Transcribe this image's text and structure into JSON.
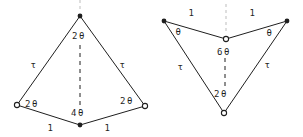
{
  "canvas": {
    "width": 303,
    "height": 137,
    "background": "#ffffff"
  },
  "style": {
    "line_color": "#1f1f1f",
    "faint_color": "#bdbdbd",
    "text_color": "#1f1f1f",
    "marker_fill_open": "#ffffff"
  },
  "diagram": {
    "type": "geometry",
    "figures": [
      {
        "name": "kite",
        "vertices": [
          {
            "id": "apex",
            "x": 80,
            "y": 16,
            "marker": "filled"
          },
          {
            "id": "left",
            "x": 17,
            "y": 105,
            "marker": "open"
          },
          {
            "id": "right",
            "x": 145,
            "y": 106,
            "marker": "open"
          },
          {
            "id": "bottom",
            "x": 80,
            "y": 125,
            "marker": "filled"
          }
        ],
        "edges": [
          {
            "from": "apex",
            "to": "left"
          },
          {
            "from": "apex",
            "to": "right"
          },
          {
            "from": "left",
            "to": "bottom"
          },
          {
            "from": "right",
            "to": "bottom"
          }
        ],
        "dashed_segments": [
          {
            "x1": 80,
            "y1": 45,
            "x2": 80,
            "y2": 110
          }
        ],
        "guide_segments": [
          {
            "x1": 80,
            "y1": 0,
            "x2": 80,
            "y2": 12
          }
        ],
        "labels": [
          {
            "text": "2θ",
            "x": 79,
            "y": 36,
            "kind": "angle"
          },
          {
            "text": "τ",
            "x": 34,
            "y": 65,
            "kind": "side"
          },
          {
            "text": "τ",
            "x": 123,
            "y": 65,
            "kind": "side"
          },
          {
            "text": "2θ",
            "x": 32,
            "y": 104,
            "kind": "angle"
          },
          {
            "text": "2θ",
            "x": 127,
            "y": 101,
            "kind": "angle"
          },
          {
            "text": "4θ",
            "x": 78,
            "y": 113,
            "kind": "angle"
          },
          {
            "text": "1",
            "x": 51,
            "y": 128,
            "kind": "side"
          },
          {
            "text": "1",
            "x": 108,
            "y": 128,
            "kind": "side"
          }
        ]
      },
      {
        "name": "dart",
        "vertices": [
          {
            "id": "top-left",
            "x": 164,
            "y": 21,
            "marker": "filled"
          },
          {
            "id": "top-right",
            "x": 287,
            "y": 21,
            "marker": "filled"
          },
          {
            "id": "middle",
            "x": 226,
            "y": 39,
            "marker": "open"
          },
          {
            "id": "bottom",
            "x": 224,
            "y": 113,
            "marker": "open"
          }
        ],
        "edges": [
          {
            "from": "top-left",
            "to": "middle"
          },
          {
            "from": "top-right",
            "to": "middle"
          },
          {
            "from": "top-left",
            "to": "bottom"
          },
          {
            "from": "top-right",
            "to": "bottom"
          }
        ],
        "dashed_segments": [
          {
            "x1": 225,
            "y1": 58,
            "x2": 225,
            "y2": 87
          }
        ],
        "guide_segments": [
          {
            "x1": 226,
            "y1": 4,
            "x2": 226,
            "y2": 33
          }
        ],
        "labels": [
          {
            "text": "1",
            "x": 192,
            "y": 13,
            "kind": "side"
          },
          {
            "text": "1",
            "x": 253,
            "y": 13,
            "kind": "side"
          },
          {
            "text": "θ",
            "x": 179,
            "y": 32,
            "kind": "angle"
          },
          {
            "text": "θ",
            "x": 270,
            "y": 33,
            "kind": "angle"
          },
          {
            "text": "6θ",
            "x": 224,
            "y": 52,
            "kind": "angle"
          },
          {
            "text": "τ",
            "x": 181,
            "y": 67,
            "kind": "side"
          },
          {
            "text": "τ",
            "x": 268,
            "y": 65,
            "kind": "side"
          },
          {
            "text": "2θ",
            "x": 221,
            "y": 94,
            "kind": "angle"
          }
        ]
      }
    ]
  }
}
